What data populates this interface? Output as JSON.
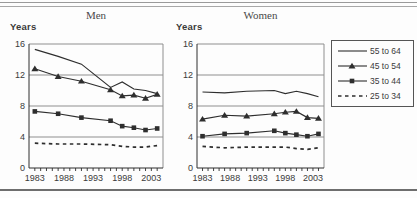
{
  "chart_data": {
    "type": "line",
    "x": [
      1983,
      1987,
      1991,
      1996,
      1998,
      2000,
      2002,
      2004
    ],
    "x_axis": {
      "min": 1982,
      "max": 2005,
      "major_tick_labels": [
        "1983",
        "1988",
        "1993",
        "1998",
        "2003"
      ],
      "minor_tick_step": 1,
      "minor_tick_start": 1983,
      "minor_tick_end": 2004
    },
    "y_axis": {
      "label": "Years",
      "min": 0,
      "max": 16,
      "ticks": [
        0,
        4,
        8,
        12,
        16
      ],
      "gridlines": [
        4,
        8,
        12,
        16
      ]
    },
    "legend": {
      "position": "right",
      "entries": [
        {
          "label": "55 to 64",
          "line": "solid",
          "marker": "none"
        },
        {
          "label": "45 to 54",
          "line": "solid",
          "marker": "triangle"
        },
        {
          "label": "35 to 44",
          "line": "solid",
          "marker": "square"
        },
        {
          "label": "25 to 34",
          "line": "dashed",
          "marker": "none"
        }
      ]
    },
    "panels": [
      {
        "title": "Men",
        "ylabel": "Years",
        "series": [
          {
            "name": "55 to 64",
            "line": "solid",
            "marker": "none",
            "values": [
              15.3,
              14.4,
              13.4,
              10.4,
              11.1,
              10.2,
              10.0,
              9.6
            ]
          },
          {
            "name": "45 to 54",
            "line": "solid",
            "marker": "triangle",
            "values": [
              12.8,
              11.8,
              11.2,
              10.1,
              9.3,
              9.4,
              9.0,
              9.5
            ]
          },
          {
            "name": "35 to 44",
            "line": "solid",
            "marker": "square",
            "values": [
              7.3,
              7.0,
              6.5,
              6.1,
              5.4,
              5.2,
              4.9,
              5.1
            ]
          },
          {
            "name": "25 to 34",
            "line": "dashed",
            "marker": "none",
            "values": [
              3.2,
              3.1,
              3.1,
              3.0,
              2.8,
              2.7,
              2.7,
              2.9
            ]
          }
        ]
      },
      {
        "title": "Women",
        "ylabel": "Years",
        "series": [
          {
            "name": "55 to 64",
            "line": "solid",
            "marker": "none",
            "values": [
              9.8,
              9.7,
              9.9,
              10.0,
              9.6,
              9.9,
              9.6,
              9.2
            ]
          },
          {
            "name": "45 to 54",
            "line": "solid",
            "marker": "triangle",
            "values": [
              6.3,
              6.8,
              6.7,
              7.0,
              7.2,
              7.3,
              6.5,
              6.4
            ]
          },
          {
            "name": "35 to 44",
            "line": "solid",
            "marker": "square",
            "values": [
              4.1,
              4.4,
              4.5,
              4.8,
              4.5,
              4.3,
              4.1,
              4.4
            ]
          },
          {
            "name": "25 to 34",
            "line": "dashed",
            "marker": "none",
            "values": [
              2.8,
              2.6,
              2.7,
              2.7,
              2.7,
              2.5,
              2.4,
              2.6
            ]
          }
        ]
      }
    ],
    "colors": {
      "line": "#2e2e2e",
      "grid": "#8f8f8f",
      "axis": "#2e2e2e",
      "text": "#3a3a3a"
    }
  }
}
